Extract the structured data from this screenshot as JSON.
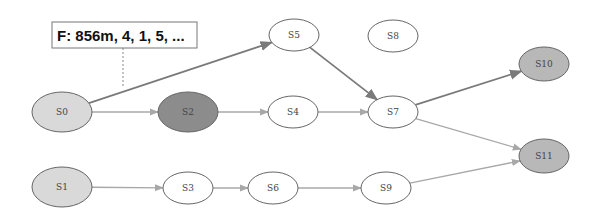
{
  "diagram": {
    "type": "state-graph",
    "callout": {
      "text": "F: 856m, 4, 1, 5, ...",
      "attached_to": "S0"
    },
    "colors": {
      "start": "#d9d9d9",
      "highlight": "#8c8c8c",
      "final": "#b8b8b8",
      "plain": "#ffffff",
      "edge_strong": "#7a7a7a",
      "edge_weak": "#a8a8a8",
      "stroke": "#666666"
    },
    "nodes": [
      {
        "id": "S0",
        "label": "S0",
        "cx": 62,
        "cy": 112,
        "rx": 30,
        "ry": 20,
        "kind": "start"
      },
      {
        "id": "S1",
        "label": "S1",
        "cx": 62,
        "cy": 187,
        "rx": 30,
        "ry": 20,
        "kind": "start"
      },
      {
        "id": "S2",
        "label": "S2",
        "cx": 188,
        "cy": 112,
        "rx": 30,
        "ry": 20,
        "kind": "highlight"
      },
      {
        "id": "S3",
        "label": "S3",
        "cx": 188,
        "cy": 188,
        "rx": 25,
        "ry": 16,
        "kind": "plain"
      },
      {
        "id": "S4",
        "label": "S4",
        "cx": 293,
        "cy": 112,
        "rx": 25,
        "ry": 16,
        "kind": "plain"
      },
      {
        "id": "S5",
        "label": "S5",
        "cx": 294,
        "cy": 35,
        "rx": 25,
        "ry": 16,
        "kind": "plain"
      },
      {
        "id": "S6",
        "label": "S6",
        "cx": 273,
        "cy": 188,
        "rx": 25,
        "ry": 16,
        "kind": "plain"
      },
      {
        "id": "S7",
        "label": "S7",
        "cx": 393,
        "cy": 112,
        "rx": 25,
        "ry": 16,
        "kind": "plain"
      },
      {
        "id": "S8",
        "label": "S8",
        "cx": 393,
        "cy": 36,
        "rx": 25,
        "ry": 16,
        "kind": "plain"
      },
      {
        "id": "S9",
        "label": "S9",
        "cx": 386,
        "cy": 188,
        "rx": 25,
        "ry": 16,
        "kind": "plain"
      },
      {
        "id": "S10",
        "label": "S10",
        "cx": 544,
        "cy": 64,
        "rx": 25,
        "ry": 17,
        "kind": "final"
      },
      {
        "id": "S11",
        "label": "S11",
        "cx": 544,
        "cy": 156,
        "rx": 25,
        "ry": 17,
        "kind": "final"
      }
    ],
    "edges": [
      {
        "from": "S0",
        "to": "S5",
        "style": "strong"
      },
      {
        "from": "S0",
        "to": "S2",
        "style": "weak"
      },
      {
        "from": "S2",
        "to": "S4",
        "style": "weak"
      },
      {
        "from": "S4",
        "to": "S7",
        "style": "weak"
      },
      {
        "from": "S5",
        "to": "S7",
        "style": "strong"
      },
      {
        "from": "S7",
        "to": "S10",
        "style": "strong"
      },
      {
        "from": "S7",
        "to": "S11",
        "style": "weak"
      },
      {
        "from": "S1",
        "to": "S3",
        "style": "weak"
      },
      {
        "from": "S3",
        "to": "S6",
        "style": "weak"
      },
      {
        "from": "S6",
        "to": "S9",
        "style": "weak"
      },
      {
        "from": "S9",
        "to": "S11",
        "style": "weak"
      }
    ]
  }
}
